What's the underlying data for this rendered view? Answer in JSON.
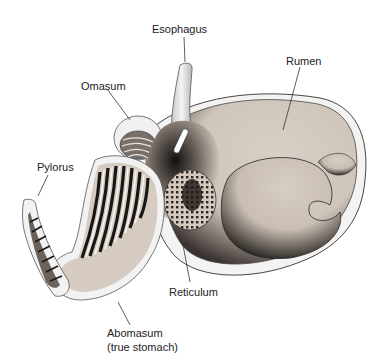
{
  "diagram": {
    "labels": {
      "esophagus": "Esophagus",
      "rumen": "Rumen",
      "omasum": "Omasum",
      "pylorus": "Pylorus",
      "reticulum": "Reticulum",
      "abomasum_line1": "Abomasum",
      "abomasum_line2": "(true stomach)"
    },
    "colors": {
      "tissue": "#d8cfc6",
      "shadow": "#2a2522",
      "outline": "#4a4540",
      "wall": "#f2f2f2"
    }
  }
}
